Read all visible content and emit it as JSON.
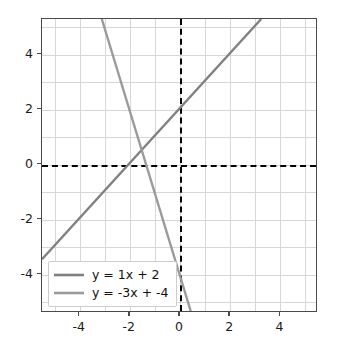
{
  "chart_data": {
    "type": "line",
    "title": "",
    "xlabel": "",
    "ylabel": "",
    "xlim": [
      -5.5,
      5.5
    ],
    "ylim": [
      -5.4,
      5.3
    ],
    "grid": true,
    "legend_position": "lower-left",
    "x_ticks": [
      "-4",
      "-2",
      "0",
      "2",
      "4"
    ],
    "x_tick_values": [
      -4,
      -2,
      0,
      2,
      4
    ],
    "y_ticks": [
      "4",
      "2",
      "0",
      "-2",
      "-4"
    ],
    "y_tick_values": [
      4,
      2,
      0,
      -2,
      -4
    ],
    "gridline_x_values": [
      -5,
      -4,
      -3,
      -2,
      -1,
      0,
      1,
      2,
      3,
      4,
      5
    ],
    "gridline_y_values": [
      -5,
      -4,
      -3,
      -2,
      -1,
      0,
      1,
      2,
      3,
      4,
      5
    ],
    "zero_axes": {
      "style": "dashed",
      "color": "#000000",
      "x_axis_at": 0,
      "y_axis_at": 0
    },
    "series": [
      {
        "name": "y = 1x + 2",
        "slope": 1,
        "intercept": 2,
        "color": "#808080",
        "points": [
          [
            -5.5,
            -3.5
          ],
          [
            3.3,
            5.3
          ]
        ]
      },
      {
        "name": "y = -3x + -4",
        "slope": -3,
        "intercept": -4,
        "color": "#9a9a9a",
        "points": [
          [
            -3.1,
            5.3
          ],
          [
            0.47,
            -5.4
          ]
        ]
      }
    ],
    "intersection": [
      -2,
      0
    ]
  },
  "legend": {
    "items": [
      {
        "label": "y = 1x + 2",
        "color": "#808080"
      },
      {
        "label": "y = -3x + -4",
        "color": "#9a9a9a"
      }
    ]
  },
  "colors": {
    "background": "#ffffff",
    "grid": "#d7d7d7",
    "frame": "#4a4a4a",
    "axis": "#000000",
    "line1": "#808080",
    "line2": "#9a9a9a",
    "tick_text": "#1a1a1a"
  }
}
